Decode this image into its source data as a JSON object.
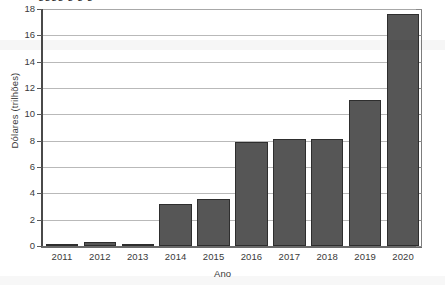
{
  "chart_data": {
    "type": "bar",
    "title": "",
    "xlabel": "Ano",
    "ylabel": "Dólares (trilhões)",
    "categories": [
      "2011",
      "2012",
      "2013",
      "2014",
      "2015",
      "2016",
      "2017",
      "2018",
      "2019",
      "2020"
    ],
    "values": [
      0.1,
      0.3,
      0.1,
      3.2,
      3.6,
      7.9,
      8.1,
      8.15,
      11.1,
      17.6
    ],
    "ylim": [
      0,
      18
    ],
    "ytick_labels": [
      "0",
      "2",
      "4",
      "6",
      "8",
      "10",
      "12",
      "14",
      "16",
      "18"
    ],
    "ytick_values": [
      0,
      2,
      4,
      6,
      8,
      10,
      12,
      14,
      16,
      18
    ],
    "grid": "horizontal",
    "legend": "none",
    "bar_color": "#565656",
    "bar_edge_color": "#2e2e2e",
    "gridline_color": "#b9b9b9",
    "axis_color": "#4a4a4a",
    "text_color": "#3a3a3a"
  },
  "figure": {
    "cropped_title_fragment": "gggg   g          g                    g"
  }
}
